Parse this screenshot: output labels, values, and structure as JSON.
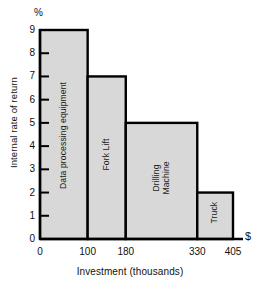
{
  "chart_data": {
    "type": "bar",
    "title": "",
    "subtitle": "",
    "xlabel": "Investment (thousands)",
    "ylabel": "Internal rate of return",
    "x_unit_symbol": "$",
    "y_unit_symbol": "%",
    "xlim": [
      0,
      405
    ],
    "ylim": [
      0,
      9
    ],
    "grid": false,
    "legend": "none",
    "y_ticks": [
      "9",
      "8",
      "7",
      "6",
      "5",
      "4",
      "3",
      "2",
      "1",
      "0"
    ],
    "y_tick_values": [
      9,
      8,
      7,
      6,
      5,
      4,
      3,
      2,
      1,
      0
    ],
    "x_ticks": [
      "0",
      "100",
      "180",
      "330",
      "405"
    ],
    "x_tick_values": [
      0,
      100,
      180,
      330,
      405
    ],
    "categories": [
      "Data processing equipment",
      "Fork Lift",
      "Drilling Machine",
      "Truck"
    ],
    "values": [
      9,
      7,
      5,
      2
    ],
    "bars": [
      {
        "label": "Data processing equipment",
        "x_start": 0,
        "x_end": 100,
        "width": 100,
        "value": 9
      },
      {
        "label": "Fork Lift",
        "x_start": 100,
        "x_end": 180,
        "width": 80,
        "value": 7
      },
      {
        "label": "Drilling Machine",
        "x_start": 180,
        "x_end": 330,
        "width": 150,
        "value": 5
      },
      {
        "label": "Truck",
        "x_start": 330,
        "x_end": 405,
        "width": 75,
        "value": 2
      }
    ],
    "colors": {
      "bar_fill": "#d8d8d8",
      "bar_stroke": "#000000",
      "axis": "#000000",
      "text": "#111111",
      "background": "#ffffff"
    }
  }
}
